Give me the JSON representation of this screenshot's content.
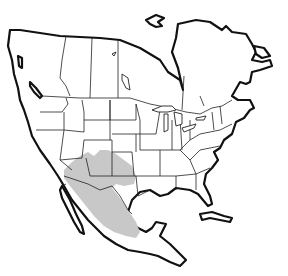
{
  "map": {
    "type": "species-range-map",
    "region": "North America",
    "colors": {
      "background": "#ffffff",
      "land": "#ffffff",
      "coastline": "#111111",
      "borders": "#222222",
      "range_fill": "#c8c8c8"
    },
    "range": {
      "label": "shaded range",
      "covers": [
        "Arizona",
        "New Mexico",
        "southern Utah",
        "southern Colorado",
        "west Texas",
        "northwestern Mexico",
        "central Mexico"
      ]
    }
  }
}
